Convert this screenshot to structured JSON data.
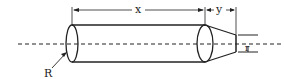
{
  "diagram": {
    "labels": {
      "left_radius": "R",
      "cylinder_length": "x",
      "frustum_length": "y",
      "right_radius": "r"
    },
    "colors": {
      "stroke": "#222222",
      "background": "#ffffff"
    }
  }
}
